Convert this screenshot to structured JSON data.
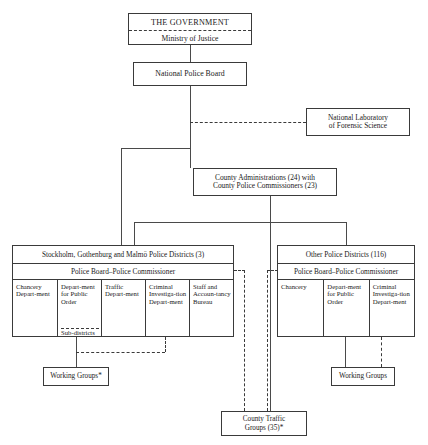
{
  "chart_title": "Organisation of the Swedish Police",
  "nodes": {
    "government": {
      "title": "THE GOVERNMENT",
      "sub": "Ministry of Justice"
    },
    "national_police_board": {
      "label": "National Police Board"
    },
    "forensic_lab": {
      "line1": "National Laboratory",
      "line2": "of Forensic Science"
    },
    "county_admin": {
      "line1": "County Administrations (24) with",
      "line2": "County Police Commissioners (23)"
    },
    "metro_districts": {
      "header": "Stockholm, Gothenburg and Malmö Police Districts (3)",
      "board": "Police Board–Police Commissioner",
      "columns": [
        {
          "label": "Chancery Depart-ment",
          "sub": null
        },
        {
          "label": "Depart-ment for Public Order",
          "sub": "Sub-districts"
        },
        {
          "label": "Traffic Depart-ment",
          "sub": null
        },
        {
          "label": "Criminal Investiga-tion Depart-ment",
          "sub": null
        },
        {
          "label": "Staff and Accoun-tancy Bureau",
          "sub": null
        }
      ]
    },
    "other_districts": {
      "header": "Other Police Districts (116)",
      "board": "Police Board–Police Commissioner",
      "columns": [
        {
          "label": "Chancery"
        },
        {
          "label": "Depart-ment for Public Order"
        },
        {
          "label": "Criminal Investiga-tion Depart-ment"
        }
      ]
    },
    "working_groups_left": {
      "label": "Working Groups*"
    },
    "working_groups_right": {
      "label": "Working Groups"
    },
    "county_traffic_groups": {
      "line1": "County Traffic",
      "line2": "Groups (35)*"
    }
  },
  "colors": {
    "background": "#ffffff",
    "line": "#4a4a4a",
    "border": "#3a3a3a",
    "text": "#1a1a1a"
  }
}
